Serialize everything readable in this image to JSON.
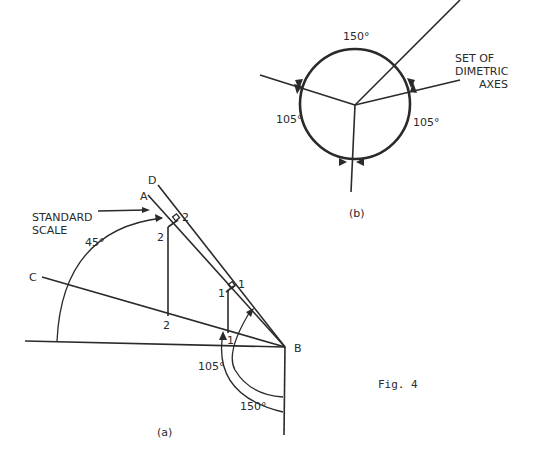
{
  "figure": {
    "caption": "Fig. 4",
    "part_a": {
      "label": "(a)",
      "points": {
        "A": "A",
        "B": "B",
        "C": "C",
        "D": "D"
      },
      "callout": {
        "line1": "STANDARD",
        "line2": "SCALE"
      },
      "angles": {
        "a45": "45°",
        "a105": "105°",
        "a150": "150°"
      },
      "ticks": {
        "t1": "1",
        "t2": "2"
      }
    },
    "part_b": {
      "label": "(b)",
      "title_lines": [
        "SET OF",
        "DIMETRIC",
        "AXES"
      ],
      "angles": {
        "top": "150°",
        "left": "105°",
        "right": "105°"
      }
    }
  }
}
